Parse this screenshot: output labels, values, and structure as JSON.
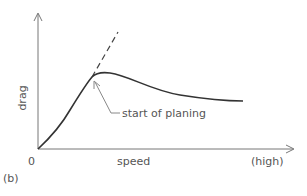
{
  "figure": {
    "panel_label": "(b)",
    "y_axis": {
      "label": "drag"
    },
    "x_axis": {
      "label": "speed",
      "origin_label": "0",
      "end_label": "(high)"
    },
    "annotation": {
      "text": "start of planing"
    },
    "series": [
      {
        "name": "drag curve",
        "style": "solid",
        "description": "rises from origin to a hump at start of planing, then falls gradually and levels off"
      },
      {
        "name": "extrapolated drag (no planing)",
        "style": "dashed",
        "description": "continues the initial steep rise beyond the hump"
      }
    ],
    "colors": {
      "axis": "#777777",
      "curve": "#333333",
      "text": "#555555"
    }
  }
}
